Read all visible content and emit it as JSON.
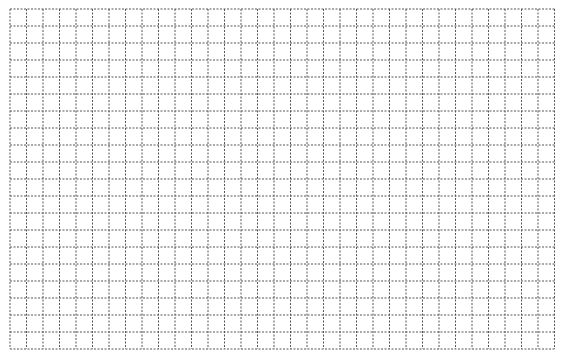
{
  "grid": {
    "left": 10,
    "top": 9,
    "columns": 33,
    "rows": 20,
    "cell_width": 16.5,
    "cell_height": 17,
    "line_color": "#555555",
    "background_color": "#ffffff",
    "line_style": "dashed"
  }
}
